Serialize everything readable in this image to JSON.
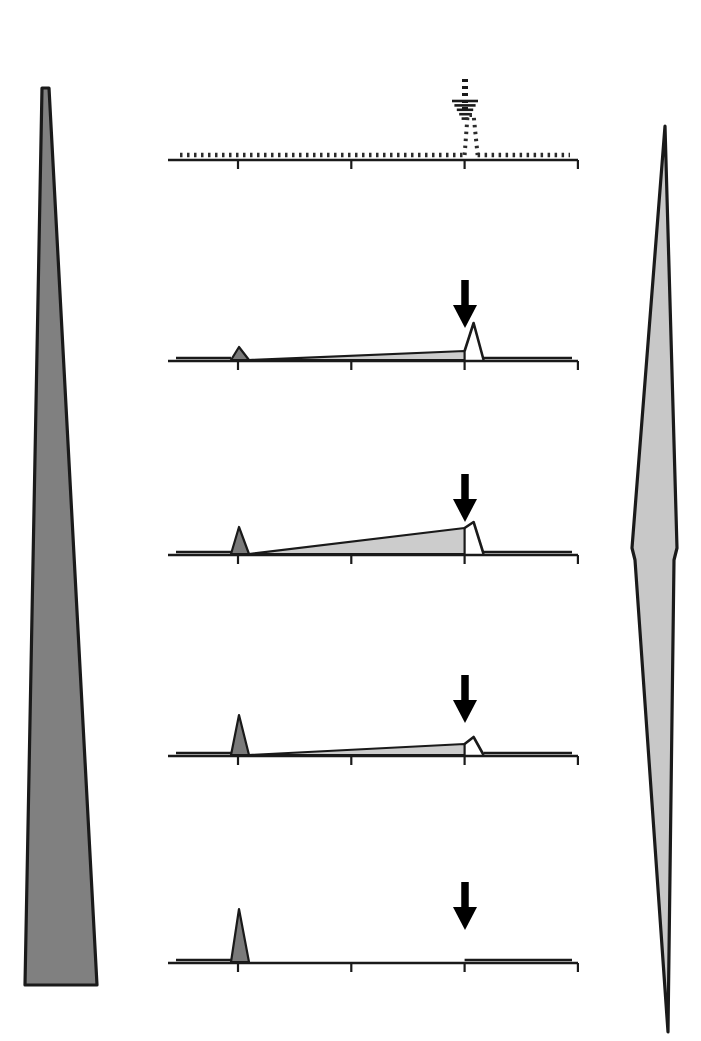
{
  "figure": {
    "type": "scientific-schematic",
    "language": "de"
  },
  "axes_left": {
    "label": "Wahrscheinlichkeit",
    "shape": "triangle-widening-downward",
    "fill": "#808080",
    "stroke": "#1a1a1a"
  },
  "axes_right": {
    "label": "Unsicherheit",
    "shape": "diamond-widest-middle",
    "fill": "#c8c8c8",
    "stroke": "#1a1a1a"
  },
  "time_axis": {
    "ticks": [
      "0",
      "1",
      "2",
      "3"
    ],
    "unit": "s",
    "range": [
      -0.6,
      3.0
    ]
  },
  "colors": {
    "cue_response_fill": "#7a7a7a",
    "ramp_fill": "#cccccc",
    "line": "#1a1a1a",
    "dotted": "#2b2b2b"
  },
  "panels": [
    {
      "probability_label": "p = 0",
      "p": 0,
      "cue_label": "Reiz",
      "cue_symbol": "♥",
      "cue_symbol_name": "heart-symbol",
      "outcome_label": "(Saft)",
      "outcome_delivered": false,
      "arrow_style": "dashed",
      "trace_style": "dotted",
      "cue_response_height": 0,
      "ramp_end_height": 0,
      "outcome_response_height": 44
    },
    {
      "probability_label": "p = 0,25",
      "p": 0.25,
      "cue_label": "Reiz",
      "cue_symbol": "△",
      "cue_symbol_name": "triangle-outline-symbol",
      "outcome_label": "Saft",
      "outcome_delivered": true,
      "arrow_style": "solid",
      "trace_style": "solid",
      "cue_response_height": 13,
      "ramp_end_height": 9,
      "outcome_response_height": 37
    },
    {
      "probability_label": "p = 0,5",
      "p": 0.5,
      "cue_label": "Reiz",
      "cue_symbol": "Ø",
      "cue_symbol_name": "slashed-circle-symbol",
      "outcome_label": "Saft",
      "outcome_delivered": true,
      "arrow_style": "solid",
      "trace_style": "solid",
      "cue_response_height": 27,
      "ramp_end_height": 26,
      "outcome_response_height": 32
    },
    {
      "probability_label": "p = 0,75",
      "p": 0.75,
      "cue_label": "Reiz",
      "cue_symbol": "∞",
      "cue_symbol_name": "infinity-symbol",
      "outcome_label": "Saft",
      "outcome_delivered": true,
      "arrow_style": "solid",
      "trace_style": "solid",
      "cue_response_height": 40,
      "ramp_end_height": 11,
      "outcome_response_height": 18
    },
    {
      "probability_label": "p = 1",
      "p": 1,
      "cue_label": "Reiz",
      "cue_symbol": "✤",
      "cue_symbol_name": "clover-symbol",
      "outcome_label": "Saft",
      "outcome_delivered": true,
      "arrow_style": "solid",
      "trace_style": "solid",
      "cue_response_height": 53,
      "ramp_end_height": 0,
      "outcome_response_height": 0
    }
  ],
  "chart_data": {
    "type": "line",
    "title": "",
    "xlabel": "s",
    "ylabel": "",
    "x": [
      0,
      1,
      2,
      3
    ],
    "series": [
      {
        "name": "p = 0",
        "cue_peak": 0,
        "ramp_at_2": 0,
        "outcome_peak": 44
      },
      {
        "name": "p = 0,25",
        "cue_peak": 13,
        "ramp_at_2": 9,
        "outcome_peak": 37
      },
      {
        "name": "p = 0,5",
        "cue_peak": 27,
        "ramp_at_2": 26,
        "outcome_peak": 32
      },
      {
        "name": "p = 0,75",
        "cue_peak": 40,
        "ramp_at_2": 11,
        "outcome_peak": 18
      },
      {
        "name": "p = 1",
        "cue_peak": 53,
        "ramp_at_2": 0,
        "outcome_peak": 0
      }
    ]
  }
}
